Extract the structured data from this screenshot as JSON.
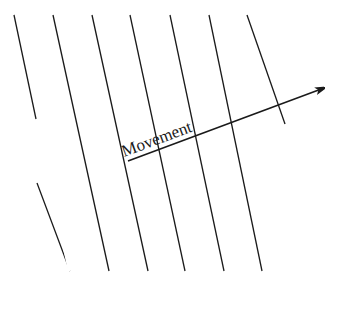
{
  "diagram": {
    "label": "Movement",
    "line_color": "#1a1a1a",
    "background": "#ffffff",
    "parallel_lines": [
      {
        "x1": 14,
        "y1": 15,
        "x2": 70,
        "y2": 271
      },
      {
        "x1": 53,
        "y1": 15,
        "x2": 109,
        "y2": 271
      },
      {
        "x1": 92,
        "y1": 15,
        "x2": 148,
        "y2": 271
      },
      {
        "x1": 130,
        "y1": 15,
        "x2": 185,
        "y2": 271
      },
      {
        "x1": 170,
        "y1": 15,
        "x2": 224,
        "y2": 271
      },
      {
        "x1": 209,
        "y1": 15,
        "x2": 262,
        "y2": 271
      },
      {
        "x1": 247,
        "y1": 15,
        "x2": 300,
        "y2": 271
      }
    ],
    "arrow": {
      "x1": 128,
      "y1": 161,
      "x2": 324,
      "y2": 88
    }
  }
}
